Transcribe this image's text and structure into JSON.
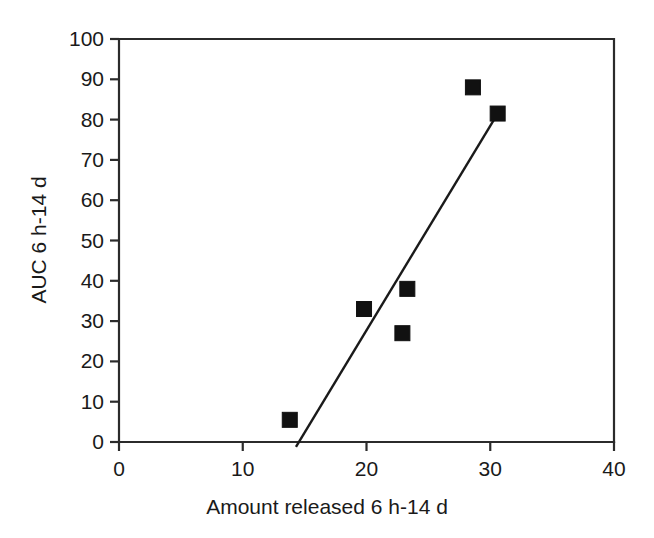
{
  "chart_data": {
    "type": "scatter",
    "title": "",
    "xlabel": "Amount released 6 h-14 d",
    "ylabel": "AUC 6 h-14 d",
    "xlim": [
      0,
      40
    ],
    "ylim": [
      0,
      100
    ],
    "xticks": [
      0,
      10,
      20,
      30,
      40
    ],
    "yticks": [
      0,
      10,
      20,
      30,
      40,
      50,
      60,
      70,
      80,
      90,
      100
    ],
    "xtick_labels": [
      "0",
      "10",
      "20",
      "30",
      "40"
    ],
    "ytick_labels": [
      "0",
      "10",
      "20",
      "30",
      "40",
      "50",
      "60",
      "70",
      "80",
      "90",
      "100"
    ],
    "grid": false,
    "legend": null,
    "marker_style": "filled-square",
    "marker_color": "#111111",
    "points": [
      {
        "x": 13.8,
        "y": 5.5
      },
      {
        "x": 19.8,
        "y": 33.0
      },
      {
        "x": 22.9,
        "y": 27.0
      },
      {
        "x": 23.3,
        "y": 38.0
      },
      {
        "x": 28.6,
        "y": 88.0
      },
      {
        "x": 30.6,
        "y": 81.5
      }
    ],
    "series": [
      {
        "name": "AUC 6 h-14 d",
        "x": [
          13.8,
          19.8,
          22.9,
          23.3,
          28.6,
          30.6
        ],
        "values": [
          5.5,
          33.0,
          27.0,
          38.0,
          88.0,
          81.5
        ]
      }
    ],
    "trend_line": {
      "type": "line",
      "color": "#1a1a1a",
      "x_start": 14.3,
      "y_start": -1.2,
      "x_end": 30.6,
      "y_end": 81.5
    }
  },
  "figure": {
    "background_color": "#ffffff",
    "axis_color": "#2b2b2b",
    "text_color": "#1a1a1a"
  }
}
